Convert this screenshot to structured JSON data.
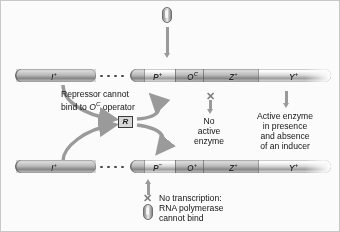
{
  "diagram": {
    "top_strand": {
      "regulator_label": "I",
      "regulator_sup": "+",
      "genes": [
        {
          "label": "P",
          "sup": "+"
        },
        {
          "label": "O",
          "sup": "C"
        },
        {
          "label": "Z",
          "sup": "+"
        },
        {
          "label": "Y",
          "sup": "+"
        }
      ]
    },
    "bottom_strand": {
      "regulator_label": "I",
      "regulator_sup": "+",
      "genes": [
        {
          "label": "P",
          "sup": "−"
        },
        {
          "label": "O",
          "sup": "+"
        },
        {
          "label": "Z",
          "sup": "+"
        },
        {
          "label": "Y",
          "sup": "+"
        }
      ]
    },
    "annotations": {
      "repressor_note_line1": "Repressor cannot",
      "repressor_note_line2_pre": "bind to ",
      "repressor_note_line2_gene": "O",
      "repressor_note_line2_sup": "C",
      "repressor_note_line2_post": " operator",
      "repressor_symbol": "R",
      "no_active_enzyme_line1": "No",
      "no_active_enzyme_line2": "active",
      "no_active_enzyme_line3": "enzyme",
      "active_enzyme_line1": "Active enzyme",
      "active_enzyme_line2": "in presence",
      "active_enzyme_line3": "and absence",
      "active_enzyme_line4": "of an inducer",
      "no_transcription_line1": "No transcription:",
      "no_transcription_line2": "RNA polymerase",
      "no_transcription_line3": "cannot bind",
      "blocked_mark": "✕"
    },
    "colors": {
      "arrow": "#9a9a9a",
      "strand_dark": "#9d9d9d",
      "text": "#141414",
      "repressor_border": "#3c3c3c"
    }
  }
}
